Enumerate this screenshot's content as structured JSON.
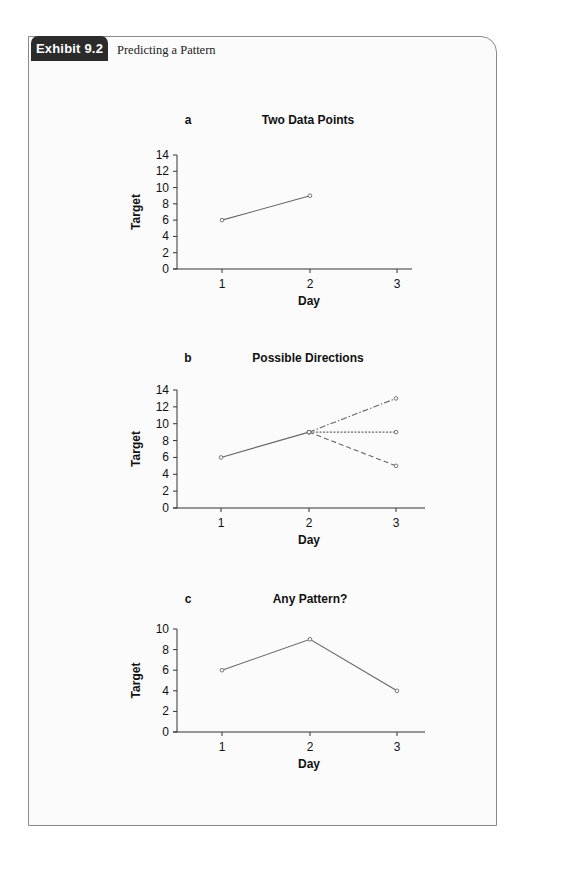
{
  "exhibit": {
    "label": "Exhibit 9.2",
    "title": "Predicting a Pattern"
  },
  "chart_data": [
    {
      "panel": "a",
      "type": "line",
      "title": "Two Data Points",
      "xlabel": "Day",
      "ylabel": "Target",
      "x_ticks": [
        "1",
        "2",
        "3"
      ],
      "y_ticks": [
        "0",
        "2",
        "4",
        "6",
        "8",
        "10",
        "12",
        "14"
      ],
      "ylim": [
        0,
        14
      ],
      "grid": false,
      "series": [
        {
          "name": "observed",
          "style": "solid",
          "x": [
            1,
            2
          ],
          "values": [
            6,
            9
          ]
        }
      ]
    },
    {
      "panel": "b",
      "type": "line",
      "title": "Possible Directions",
      "xlabel": "Day",
      "ylabel": "Target",
      "x_ticks": [
        "1",
        "2",
        "3"
      ],
      "y_ticks": [
        "0",
        "2",
        "4",
        "6",
        "8",
        "10",
        "12",
        "14"
      ],
      "ylim": [
        0,
        14
      ],
      "grid": false,
      "series": [
        {
          "name": "observed",
          "style": "solid",
          "x": [
            1,
            2
          ],
          "values": [
            6,
            9
          ]
        },
        {
          "name": "increase",
          "style": "dash-dot",
          "x": [
            2,
            3
          ],
          "values": [
            9,
            13
          ]
        },
        {
          "name": "level",
          "style": "dotted",
          "x": [
            2,
            3
          ],
          "values": [
            9,
            9
          ]
        },
        {
          "name": "decrease",
          "style": "dashed",
          "x": [
            2,
            3
          ],
          "values": [
            9,
            5
          ]
        }
      ]
    },
    {
      "panel": "c",
      "type": "line",
      "title": "Any Pattern?",
      "xlabel": "Day",
      "ylabel": "Target",
      "x_ticks": [
        "1",
        "2",
        "3"
      ],
      "y_ticks": [
        "0",
        "2",
        "4",
        "6",
        "8",
        "10"
      ],
      "ylim": [
        0,
        10
      ],
      "grid": false,
      "series": [
        {
          "name": "observed",
          "style": "solid",
          "x": [
            1,
            2,
            3
          ],
          "values": [
            6,
            9,
            4
          ]
        }
      ]
    }
  ]
}
